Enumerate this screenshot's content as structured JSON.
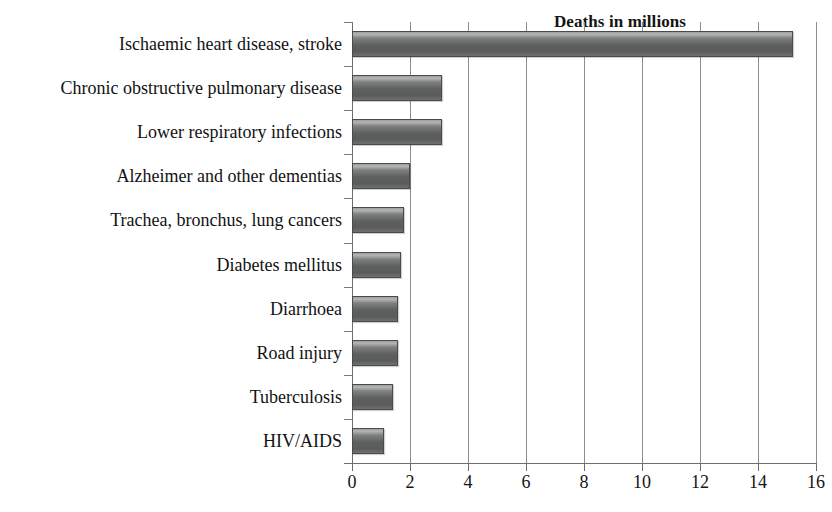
{
  "chart_data": {
    "type": "bar",
    "orientation": "horizontal",
    "title": "Deaths in millions",
    "xlabel": "",
    "ylabel": "",
    "xlim": [
      0,
      16
    ],
    "xticks": [
      0,
      2,
      4,
      6,
      8,
      10,
      12,
      14,
      16
    ],
    "xtick_labels": [
      "0",
      "2",
      "4",
      "6",
      "8",
      "10",
      "12",
      "14",
      "16"
    ],
    "grid": "vertical",
    "legend": "none",
    "categories": [
      "Ischaemic heart disease, stroke",
      "Chronic obstructive pulmonary disease",
      "Lower respiratory infections",
      "Alzheimer and other dementias",
      "Trachea, bronchus, lung cancers",
      "Diabetes mellitus",
      "Diarrhoea",
      "Road injury",
      "Tuberculosis",
      "HIV/AIDS"
    ],
    "values": [
      15.2,
      3.1,
      3.1,
      2.0,
      1.8,
      1.7,
      1.6,
      1.6,
      1.4,
      1.1
    ],
    "bar_color": "#5e5f5f",
    "bar_edge_color": "#4a4a4a",
    "grid_color": "#8d8d8d",
    "axis_color": "#6e6e6e",
    "text_color": "#141414"
  }
}
